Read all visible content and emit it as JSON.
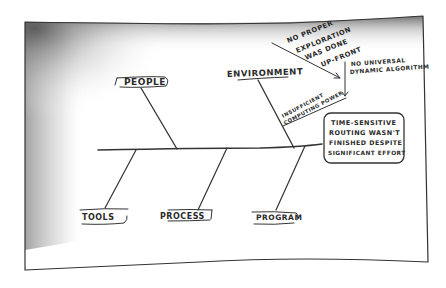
{
  "diagram": {
    "type": "fishbone",
    "style": "hand-drawn sketch on paper",
    "colors": {
      "paper": "#ffffff",
      "ink": "#2a2a2a",
      "shadow": "#8a8a8a"
    },
    "effect_box": {
      "lines": [
        "TIME-SENSITIVE",
        "ROUTING WASN'T",
        "FINISHED DESPITE",
        "SIGNIFICANT EFFORT"
      ]
    },
    "categories": {
      "top": [
        {
          "label": "PEOPLE"
        },
        {
          "label": "ENVIRONMENT"
        }
      ],
      "bottom": [
        {
          "label": "TOOLS"
        },
        {
          "label": "PROCESS"
        },
        {
          "label": "PROGRAM"
        }
      ]
    },
    "causes": {
      "no_proper_exploration": [
        "NO PROPER",
        "EXPLORATION",
        "WAS DONE",
        "UP-FRONT"
      ],
      "no_universal_algorithm": [
        "NO UNIVERSAL",
        "DYNAMIC ALGORITHM"
      ],
      "insufficient_power": [
        "INSUFFICIENT",
        "COMPUTING POWER"
      ]
    }
  }
}
